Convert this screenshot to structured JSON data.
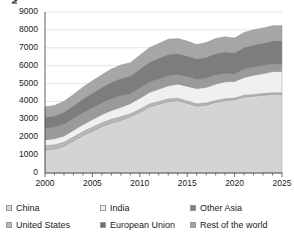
{
  "chart_data": {
    "type": "area",
    "title": "",
    "subtitle": "",
    "xlabel": "",
    "ylabel": "Mt",
    "stacked": true,
    "grid": true,
    "legend_position": "bottom",
    "xlim": [
      2000,
      2025
    ],
    "ylim": [
      0,
      9000
    ],
    "ytick_labels": [
      "9000",
      "8000",
      "7000",
      "6000",
      "5000",
      "4000",
      "3000",
      "2000",
      "1000",
      "0"
    ],
    "ytick_values": [
      9000,
      8000,
      7000,
      6000,
      5000,
      4000,
      3000,
      2000,
      1000,
      0
    ],
    "xtick_labels": [
      "2000",
      "2005",
      "2010",
      "2015",
      "2020",
      "2025"
    ],
    "xtick_values": [
      2000,
      2005,
      2010,
      2015,
      2020,
      2025
    ],
    "x": [
      2000,
      2001,
      2002,
      2003,
      2004,
      2005,
      2006,
      2007,
      2008,
      2009,
      2010,
      2011,
      2012,
      2013,
      2014,
      2015,
      2016,
      2017,
      2018,
      2019,
      2020,
      2021,
      2022,
      2023,
      2024,
      2025
    ],
    "series": [
      {
        "name": "China",
        "color": "#d4d4d4",
        "values": [
          1300,
          1350,
          1500,
          1800,
          2100,
          2350,
          2600,
          2800,
          2950,
          3150,
          3400,
          3700,
          3850,
          4000,
          4050,
          3900,
          3750,
          3800,
          3950,
          4050,
          4100,
          4250,
          4300,
          4350,
          4400,
          4400
        ]
      },
      {
        "name": "United States",
        "color": "#b9b9b9",
        "values": [
          230,
          220,
          215,
          210,
          210,
          210,
          205,
          200,
          190,
          150,
          160,
          155,
          140,
          140,
          135,
          125,
          115,
          110,
          105,
          100,
          90,
          95,
          95,
          90,
          90,
          85
        ]
      },
      {
        "name": "India",
        "color": "#f0f0f0",
        "values": [
          330,
          350,
          360,
          380,
          400,
          430,
          460,
          500,
          540,
          590,
          620,
          650,
          700,
          740,
          790,
          830,
          860,
          880,
          920,
          950,
          930,
          1000,
          1070,
          1120,
          1180,
          1200
        ]
      },
      {
        "name": "European Union",
        "color": "#9a9a9a",
        "values": [
          640,
          630,
          640,
          650,
          650,
          640,
          640,
          640,
          620,
          530,
          560,
          570,
          560,
          540,
          520,
          520,
          500,
          500,
          490,
          450,
          420,
          450,
          440,
          430,
          420,
          410
        ]
      },
      {
        "name": "Other Asia",
        "color": "#7d7d7d",
        "values": [
          620,
          640,
          680,
          720,
          780,
          830,
          880,
          930,
          980,
          1000,
          1060,
          1120,
          1160,
          1200,
          1180,
          1170,
          1150,
          1180,
          1210,
          1220,
          1180,
          1220,
          1250,
          1270,
          1290,
          1300
        ]
      },
      {
        "name": "Rest of the world",
        "color": "#a6a6a6",
        "values": [
          580,
          590,
          610,
          630,
          660,
          690,
          710,
          740,
          760,
          750,
          780,
          810,
          830,
          860,
          840,
          830,
          810,
          820,
          840,
          850,
          820,
          840,
          850,
          850,
          850,
          850
        ]
      }
    ],
    "totals": [
      3700,
      3780,
      4005,
      4390,
      4800,
      5150,
      5495,
      5810,
      6040,
      6170,
      6580,
      7005,
      7240,
      7480,
      7515,
      7375,
      7185,
      7290,
      7515,
      7620,
      7540,
      7855,
      8005,
      8110,
      8230,
      8245
    ]
  },
  "axis": {
    "unit": "Mt"
  },
  "legend": {
    "rows": [
      [
        {
          "label": "China",
          "color": "#d4d4d4"
        },
        {
          "label": "India",
          "color": "#f0f0f0"
        },
        {
          "label": "Other Asia",
          "color": "#7d7d7d"
        }
      ],
      [
        {
          "label": "United States",
          "color": "#b9b9b9"
        },
        {
          "label": "European Union",
          "color": "#6f6f6f"
        },
        {
          "label": "Rest of the world",
          "color": "#a6a6a6"
        }
      ]
    ]
  }
}
